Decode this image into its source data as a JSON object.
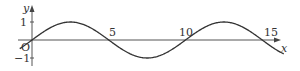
{
  "chart_data": {
    "type": "line",
    "title": "",
    "function": "y = sin(pi x / 5)",
    "xlabel": "x",
    "ylabel": "y",
    "origin_label": "O",
    "x_ticks": [
      5,
      10,
      15
    ],
    "x_tick_labels": [
      "5",
      "10",
      "15"
    ],
    "y_ticks": [
      1,
      -1
    ],
    "y_tick_labels": [
      "1",
      "−1"
    ],
    "xlim": [
      -0.8,
      16.5
    ],
    "ylim": [
      -1.4,
      1.6
    ],
    "grid": false,
    "legend": null,
    "series": [
      {
        "name": "sine curve",
        "x": [
          -0.8,
          0,
          2.5,
          5,
          7.5,
          10,
          12.5,
          15,
          16.4
        ],
        "y": [
          -0.48,
          0,
          1,
          0,
          -1,
          0,
          1,
          0,
          -0.77
        ],
        "color": "#333333"
      }
    ]
  },
  "layout": {
    "origin_px": [
      32,
      40
    ],
    "px_per_unit_x": 15.35,
    "px_per_unit_y": 18,
    "axis_color": "#444444",
    "curve_color": "#333333"
  }
}
